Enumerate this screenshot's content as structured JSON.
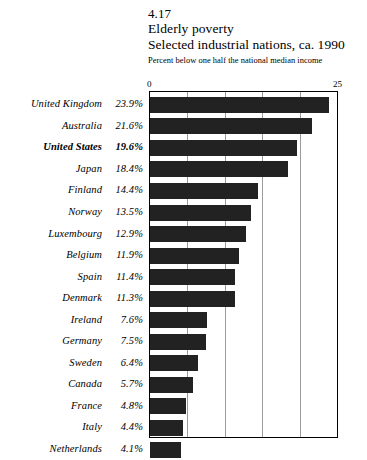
{
  "figure": {
    "number": "4.17",
    "title": "Elderly poverty",
    "subtitle": "Selected industrial nations, ca. 1990",
    "caption": "Percent below one half the national median income"
  },
  "axis": {
    "min_label": "0",
    "max_label": "25"
  },
  "chart_data": {
    "type": "bar",
    "orientation": "horizontal",
    "title": "Elderly poverty",
    "subtitle": "Selected industrial nations, ca. 1990",
    "xlabel": "Percent below one half the national median income",
    "ylabel": "",
    "xlim": [
      0,
      25
    ],
    "xticks": [
      0,
      5,
      10,
      15,
      20,
      25
    ],
    "xtick_labels_shown": [
      "0",
      "25"
    ],
    "grid": "vertical",
    "gridline_values": [
      5,
      10,
      15,
      20
    ],
    "legend": "none",
    "bar_color": "#222222",
    "categories": [
      "United Kingdom",
      "Australia",
      "United States",
      "Japan",
      "Finland",
      "Norway",
      "Luxembourg",
      "Belgium",
      "Spain",
      "Denmark",
      "Ireland",
      "Germany",
      "Sweden",
      "Canada",
      "France",
      "Italy",
      "Netherlands"
    ],
    "values": [
      23.9,
      21.6,
      19.6,
      18.4,
      14.4,
      13.5,
      12.9,
      11.9,
      11.4,
      11.3,
      7.6,
      7.5,
      6.4,
      5.7,
      4.8,
      4.4,
      4.1
    ],
    "value_labels": [
      "23.9%",
      "21.6%",
      "19.6%",
      "18.4%",
      "14.4%",
      "13.5%",
      "12.9%",
      "11.9%",
      "11.4%",
      "11.3%",
      "7.6%",
      "7.5%",
      "6.4%",
      "5.7%",
      "4.8%",
      "4.4%",
      "4.1%"
    ],
    "highlighted_category": "United States"
  }
}
